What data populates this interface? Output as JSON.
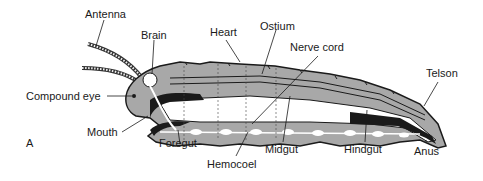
{
  "figure": {
    "panel_letter": "A",
    "colors": {
      "body_fill": "#a8a8a8",
      "outline": "#1a1a1a",
      "gut_lumen": "#ffffff",
      "background": "#ffffff"
    },
    "labels": {
      "antenna": "Antenna",
      "brain": "Brain",
      "heart": "Heart",
      "ostium": "Ostium",
      "nerve_cord": "Nerve cord",
      "telson": "Telson",
      "compound_eye": "Compound eye",
      "mouth": "Mouth",
      "foregut": "Foregut",
      "hemocoel": "Hemocoel",
      "midgut": "Midgut",
      "hindgut": "Hindgut",
      "anus": "Anus"
    }
  }
}
